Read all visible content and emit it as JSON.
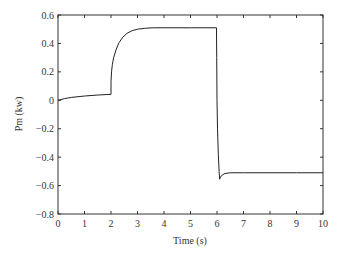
{
  "chart_data": {
    "type": "line",
    "title": "",
    "xlabel": "Time (s)",
    "ylabel": "Pm (kw)",
    "xlim": [
      0,
      10
    ],
    "ylim": [
      -0.8,
      0.6
    ],
    "grid": false,
    "legend": null,
    "xticks": [
      0,
      1,
      2,
      3,
      4,
      5,
      6,
      7,
      8,
      9,
      10
    ],
    "xtick_labels": [
      "0",
      "1",
      "2",
      "3",
      "4",
      "5",
      "6",
      "7",
      "8",
      "9",
      "10"
    ],
    "yticks": [
      0.6,
      0.4,
      0.2,
      0,
      -0.2,
      -0.4,
      -0.6,
      -0.8
    ],
    "ytick_labels": [
      "0.6",
      "0.4",
      "0.2",
      "0",
      "−0.2",
      "−0.4",
      "−0.6",
      "−0.8"
    ],
    "series": [
      {
        "name": "Pm",
        "color": "#222222",
        "x": [
          0,
          0.25,
          0.5,
          1.0,
          1.5,
          2.0,
          2.0,
          2.02,
          2.05,
          2.1,
          2.2,
          2.3,
          2.45,
          2.6,
          2.8,
          3.0,
          3.3,
          3.6,
          4.0,
          5.0,
          5.98,
          5.99,
          6.0,
          6.02,
          6.05,
          6.08,
          6.1,
          6.13,
          6.2,
          6.3,
          6.5,
          7.0,
          8.0,
          9.0,
          10.0
        ],
        "values": [
          0.0,
          0.012,
          0.02,
          0.03,
          0.037,
          0.042,
          0.13,
          0.2,
          0.25,
          0.3,
          0.36,
          0.405,
          0.445,
          0.47,
          0.49,
          0.5,
          0.507,
          0.51,
          0.51,
          0.51,
          0.51,
          0.3,
          0.0,
          -0.2,
          -0.38,
          -0.5,
          -0.555,
          -0.54,
          -0.525,
          -0.515,
          -0.51,
          -0.51,
          -0.51,
          -0.51,
          -0.51
        ]
      }
    ]
  }
}
